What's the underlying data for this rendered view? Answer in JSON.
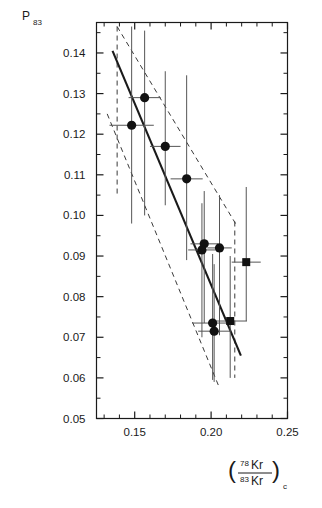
{
  "chart_data": {
    "type": "scatter",
    "title": "",
    "subtitle": "",
    "xlabel": "(78Kr/83Kr)c",
    "xlabel_parts": {
      "open_paren": "(",
      "num_sup": "78",
      "num_base": "Kr",
      "den_sup": "83",
      "den_base": "Kr",
      "close_paren": ")",
      "subscript": "c"
    },
    "ylabel": "P83",
    "ylabel_parts": {
      "base": "P",
      "sub": "83"
    },
    "xlim": [
      0.125,
      0.25
    ],
    "ylim": [
      0.05,
      0.1475
    ],
    "xticks_major": [
      0.15,
      0.2,
      0.25
    ],
    "xticklabels": [
      "0.15",
      "0.20",
      "0.25"
    ],
    "xticks_minor": [
      0.13,
      0.14,
      0.16,
      0.17,
      0.18,
      0.19,
      0.21,
      0.22,
      0.23,
      0.24
    ],
    "yticks_major": [
      0.05,
      0.06,
      0.07,
      0.08,
      0.09,
      0.1,
      0.11,
      0.12,
      0.13,
      0.14
    ],
    "yticklabels": [
      "0.05",
      "0.06",
      "0.07",
      "0.08",
      "0.09",
      "0.10",
      "0.11",
      "0.12",
      "0.13",
      "0.14"
    ],
    "grid": false,
    "legend": "none",
    "marker_color": "#111111",
    "line_color": "#1a1a1a",
    "band_color": "#3a3a3a",
    "errorbar_color": "#555555",
    "series": [
      {
        "name": "circles",
        "marker": "circle",
        "points": [
          {
            "x": 0.1565,
            "y": 0.129,
            "xerr": 0.0105,
            "ylo": 0.1,
            "yhi": 0.1455
          },
          {
            "x": 0.148,
            "y": 0.1222,
            "xerr": 0.0145,
            "ylo": 0.098,
            "yhi": 0.1465
          },
          {
            "x": 0.17,
            "y": 0.117,
            "xerr": 0.01,
            "ylo": 0.1025,
            "yhi": 0.1355
          },
          {
            "x": 0.184,
            "y": 0.109,
            "xerr": 0.0105,
            "ylo": 0.089,
            "yhi": 0.1345
          },
          {
            "x": 0.1955,
            "y": 0.093,
            "xerr": 0.009,
            "ylo": 0.0735,
            "yhi": 0.106
          },
          {
            "x": 0.194,
            "y": 0.0915,
            "xerr": 0.009,
            "ylo": 0.07,
            "yhi": 0.103
          },
          {
            "x": 0.2055,
            "y": 0.092,
            "xerr": 0.008,
            "ylo": 0.0705,
            "yhi": 0.105
          },
          {
            "x": 0.201,
            "y": 0.0735,
            "xerr": 0.0135,
            "ylo": 0.0595,
            "yhi": 0.0905
          },
          {
            "x": 0.202,
            "y": 0.0715,
            "xerr": 0.0105,
            "ylo": 0.059,
            "yhi": 0.088
          }
        ]
      },
      {
        "name": "squares",
        "marker": "square",
        "points": [
          {
            "x": 0.223,
            "y": 0.0885,
            "xerr": 0.0095,
            "ylo": 0.074,
            "yhi": 0.107
          },
          {
            "x": 0.2125,
            "y": 0.074,
            "xerr": 0.011,
            "ylo": 0.06,
            "yhi": 0.09
          }
        ]
      }
    ],
    "fit_line": {
      "x1": 0.1355,
      "y1": 0.1405,
      "x2": 0.2195,
      "y2": 0.0655
    },
    "band_upper": {
      "x1": 0.1385,
      "y1": 0.1465,
      "x2": 0.216,
      "y2": 0.098
    },
    "band_lower": {
      "x1": 0.132,
      "y1": 0.125,
      "x2": 0.2055,
      "y2": 0.0575
    },
    "band_left_edge": {
      "x": 0.1385,
      "y1": 0.1465,
      "y2": 0.1045
    },
    "band_right_edge": {
      "x": 0.2155,
      "y1": 0.0985,
      "y2": 0.06
    },
    "annotations": []
  }
}
